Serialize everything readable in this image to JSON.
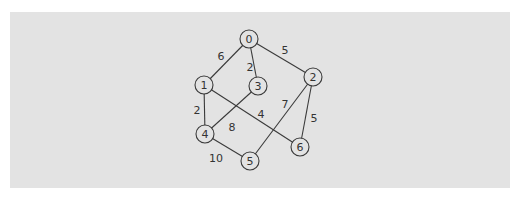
{
  "diagram": {
    "type": "weighted-undirected-graph",
    "background": "#e3e3e3",
    "nodes": [
      {
        "id": "0",
        "label": "0",
        "x": 249,
        "y": 39
      },
      {
        "id": "1",
        "label": "1",
        "x": 204,
        "y": 85
      },
      {
        "id": "2",
        "label": "2",
        "x": 313,
        "y": 77
      },
      {
        "id": "3",
        "label": "3",
        "x": 258,
        "y": 86
      },
      {
        "id": "4",
        "label": "4",
        "x": 205,
        "y": 134
      },
      {
        "id": "5",
        "label": "5",
        "x": 250,
        "y": 161
      },
      {
        "id": "6",
        "label": "6",
        "x": 300,
        "y": 147
      }
    ],
    "edges": [
      {
        "from": "0",
        "to": "1",
        "weight": "6",
        "lx": 221,
        "ly": 56
      },
      {
        "from": "0",
        "to": "3",
        "weight": "2",
        "lx": 250,
        "ly": 67
      },
      {
        "from": "0",
        "to": "2",
        "weight": "5",
        "lx": 285,
        "ly": 50
      },
      {
        "from": "1",
        "to": "4",
        "weight": "2",
        "lx": 197,
        "ly": 110
      },
      {
        "from": "1",
        "to": "6",
        "weight": "4",
        "lx": 261,
        "ly": 114
      },
      {
        "from": "3",
        "to": "4",
        "weight": "8",
        "lx": 232,
        "ly": 127
      },
      {
        "from": "2",
        "to": "5",
        "weight": "7",
        "lx": 285,
        "ly": 104
      },
      {
        "from": "2",
        "to": "6",
        "weight": "5",
        "lx": 314,
        "ly": 118
      },
      {
        "from": "4",
        "to": "5",
        "weight": "10",
        "lx": 216,
        "ly": 158
      }
    ]
  }
}
